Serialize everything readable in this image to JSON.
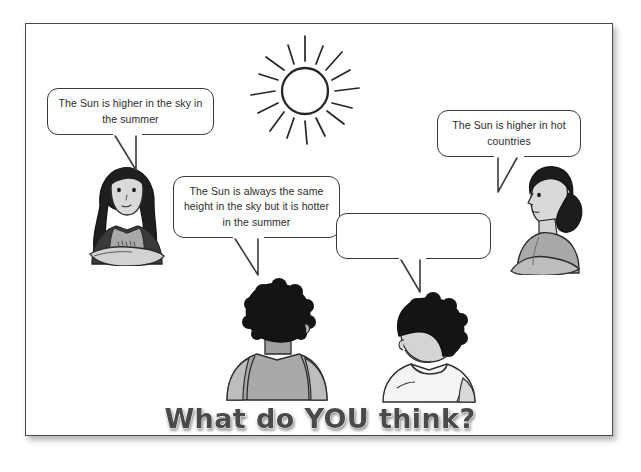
{
  "page": {
    "title": "What do YOU think?",
    "background_color": "#ffffff",
    "border_color": "#4a4a4a",
    "text_color": "#2b2b2b"
  },
  "sun": {
    "icon": "sun-icon",
    "ray_count": 16
  },
  "speech_bubbles": [
    {
      "id": "bubble-sun-higher-summer",
      "speaker": "girl-long-hair",
      "lines": [
        "The Sun is higher in the sky",
        "in the summer"
      ],
      "text": "The Sun is higher in the sky in the summer",
      "empty": false
    },
    {
      "id": "bubble-same-height-hotter",
      "speaker": "child-afro-back",
      "lines": [
        "The Sun is always the same",
        "height in the sky but it is",
        "hotter in the summer"
      ],
      "text": "The Sun is always the same height in the sky but it is hotter in the summer",
      "empty": false
    },
    {
      "id": "bubble-hot-countries",
      "speaker": "girl-ponytail",
      "lines": [
        "The Sun is higher in",
        "hot countries"
      ],
      "text": "The Sun is higher in hot countries",
      "empty": false
    },
    {
      "id": "bubble-blank",
      "speaker": "boy-white-shirt",
      "lines": [],
      "text": "",
      "empty": true
    }
  ],
  "people": [
    {
      "id": "girl-long-hair",
      "description": "Girl with long dark hair, arms folded"
    },
    {
      "id": "girl-ponytail",
      "description": "Girl in profile with dark ponytail"
    },
    {
      "id": "child-afro-back",
      "description": "Child seen from behind with afro hair and grey vest"
    },
    {
      "id": "boy-white-shirt",
      "description": "Boy seen from behind with afro hair and white t-shirt"
    }
  ],
  "colors": {
    "outline": "#2b2b2b",
    "hair_dark": "#1c1c1c",
    "skin": "#d7d7d7",
    "clothing_grey": "#a8a8a8",
    "clothing_light": "#f2f2f2",
    "title_fill": "#4a4a4a"
  }
}
